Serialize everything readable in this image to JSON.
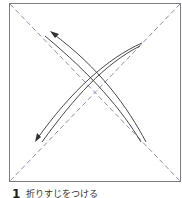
{
  "diagram": {
    "type": "origami-instruction",
    "square": {
      "x": 9,
      "y": 3,
      "width": 171,
      "height": 178,
      "stroke": "#7d7d7d"
    },
    "diagonals": {
      "stroke": "#8a8fb8",
      "dash": "5,3",
      "style": "dashed valley-fold crease lines"
    },
    "arrows": [
      {
        "name": "fold-arrow-top-left-to-bottom-right",
        "from": [
          146,
          142
        ],
        "to": [
          50,
          32
        ],
        "head": "top-left",
        "style": "double-line curved"
      },
      {
        "name": "fold-arrow-top-right-to-bottom-left",
        "from": [
          142,
          43
        ],
        "to": [
          36,
          140
        ],
        "head": "bottom-left",
        "style": "double-line curved"
      }
    ],
    "arrow_color": "#333333"
  },
  "caption": {
    "step_number": "1",
    "text": "折りすじをつける"
  }
}
